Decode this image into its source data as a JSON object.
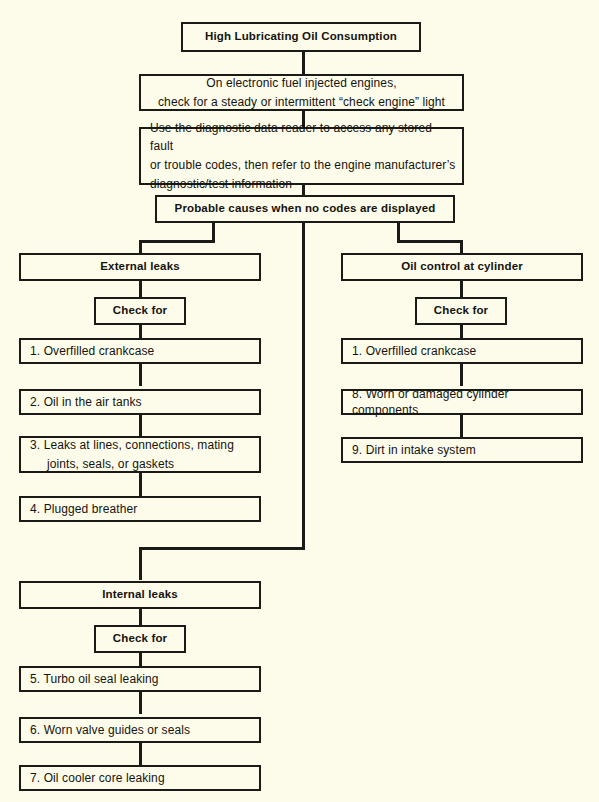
{
  "diagram": {
    "title": "High Lubricating Oil Consumption",
    "type": "troubleshooting-flowchart",
    "background_color": "#fdfcea",
    "line_color": "#1a1a17",
    "text_color": "#14130f"
  },
  "nodes": {
    "root": "High Lubricating Oil Consumption",
    "step_efi_line1": "On electronic fuel injected engines,",
    "step_efi_line2": "check for a steady or intermittent “check engine” light",
    "step_reader_line1": "Use the diagnostic data reader to access any stored fault",
    "step_reader_line2": "or trouble codes, then refer to the engine manufacturer’s",
    "step_reader_line3": "diagnostic/test information",
    "probable_causes": "Probable causes when no codes are displayed"
  },
  "branches": {
    "external": {
      "heading": "External leaks",
      "check_for": "Check for",
      "items": [
        {
          "text": "1. Overfilled crankcase"
        },
        {
          "text": "2. Oil in the air tanks"
        },
        {
          "line1": "3. Leaks at lines, connections, mating",
          "line2": "joints, seals, or gaskets"
        },
        {
          "text": "4. Plugged breather"
        }
      ]
    },
    "cylinder": {
      "heading": "Oil control at cylinder",
      "check_for": "Check for",
      "items": [
        {
          "text": "1. Overfilled crankcase"
        },
        {
          "text": "8. Worn or damaged cylinder components"
        },
        {
          "text": "9. Dirt in intake system"
        }
      ]
    },
    "internal": {
      "heading": "Internal leaks",
      "check_for": "Check for",
      "items": [
        {
          "text": "5. Turbo oil seal leaking"
        },
        {
          "text": "6. Worn valve guides or seals"
        },
        {
          "text": "7. Oil cooler core leaking"
        }
      ]
    }
  }
}
